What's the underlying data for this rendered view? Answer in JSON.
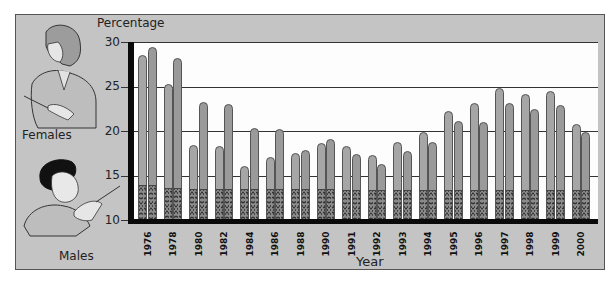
{
  "chart_data": {
    "type": "bar",
    "title": "",
    "xlabel": "Year",
    "ylabel": "Percentage",
    "ylim": [
      10,
      30
    ],
    "yticks": [
      10,
      15,
      20,
      25,
      30
    ],
    "grid": true,
    "legend_position": "left (illustrated figures)",
    "categories": [
      "1976",
      "1978",
      "1980",
      "1982",
      "1984",
      "1986",
      "1988",
      "1990",
      "1991",
      "1992",
      "1993",
      "1994",
      "1995",
      "1996",
      "1997",
      "1998",
      "1999",
      "2000"
    ],
    "series": [
      {
        "name": "Females",
        "values": [
          28.5,
          25.3,
          18.4,
          18.3,
          16.1,
          17.1,
          17.5,
          18.7,
          18.3,
          17.3,
          18.8,
          19.9,
          22.3,
          23.2,
          24.8,
          24.2,
          24.5,
          20.8
        ]
      },
      {
        "name": "Males",
        "values": [
          29.4,
          28.2,
          23.3,
          23.0,
          20.3,
          20.2,
          17.9,
          19.1,
          17.4,
          16.3,
          17.7,
          18.8,
          21.1,
          21.0,
          23.2,
          22.5,
          22.9,
          19.9
        ]
      }
    ],
    "baseline_segment_value": [
      13.9,
      13.6,
      13.5,
      13.5,
      13.5,
      13.5,
      13.5,
      13.5,
      13.4,
      13.4,
      13.4,
      13.4,
      13.4,
      13.4,
      13.4,
      13.4,
      13.4,
      13.4
    ]
  },
  "labels": {
    "ylabel": "Percentage",
    "xlabel": "Year",
    "females": "Females",
    "males": "Males"
  },
  "ticks": [
    "30",
    "25",
    "20",
    "15",
    "10"
  ],
  "colors": {
    "panel": "#c4c4c4",
    "plot": "#fdfdfd",
    "female_bar": "#a6a6a6",
    "male_bar": "#9a9a9a",
    "stipple": "#8a8a8a"
  }
}
